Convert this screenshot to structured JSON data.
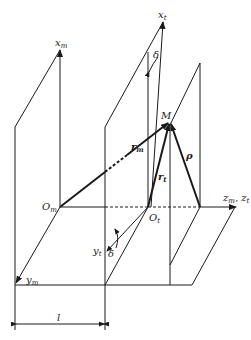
{
  "diagram": {
    "labels": {
      "x_m": {
        "base": "x",
        "sub": "m"
      },
      "x_t": {
        "base": "x",
        "sub": "t"
      },
      "y_m": {
        "base": "y",
        "sub": "m"
      },
      "y_t": {
        "base": "y",
        "sub": "t"
      },
      "z_axis": {
        "base": "z",
        "sub": "m",
        "sep": ", ",
        "base2": "z",
        "sub2": "t"
      },
      "O_m": {
        "base": "O",
        "sub": "m"
      },
      "O_t": {
        "base": "O",
        "sub": "t"
      },
      "M": "M",
      "r_m": {
        "base": "r",
        "sub": "m"
      },
      "r_t": {
        "base": "r",
        "sub": "t"
      },
      "rho": "ρ",
      "delta_top": "δ",
      "delta_bottom": "δ",
      "l": "l"
    },
    "line_color": "#1a1a1a",
    "background": "#ffffff"
  }
}
